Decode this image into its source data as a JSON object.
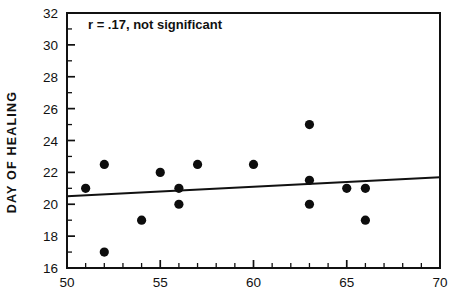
{
  "chart_data": {
    "type": "scatter",
    "title": "",
    "xlabel": "",
    "ylabel": "DAY OF HEALING",
    "xlim": [
      50,
      70
    ],
    "ylim": [
      16,
      32
    ],
    "grid": false,
    "legend": "none",
    "x_ticks": [
      50,
      55,
      60,
      65,
      70
    ],
    "x_tick_labels": [
      "50",
      "55",
      "60",
      "65",
      "70"
    ],
    "x_minor_step": 1,
    "y_ticks": [
      16,
      18,
      20,
      22,
      24,
      26,
      28,
      30,
      32
    ],
    "y_tick_labels": [
      "16",
      "18",
      "20",
      "22",
      "24",
      "26",
      "28",
      "30",
      "32"
    ],
    "y_minor_step": 1,
    "annotation": "r = .17, not significant",
    "correlation_r": 0.17,
    "significance": "not significant",
    "marker": "filled-circle",
    "marker_color": "#0d0d0d",
    "points": [
      {
        "x": 51,
        "y": 21
      },
      {
        "x": 52,
        "y": 22.5
      },
      {
        "x": 52,
        "y": 17
      },
      {
        "x": 54,
        "y": 19
      },
      {
        "x": 55,
        "y": 22
      },
      {
        "x": 56,
        "y": 21
      },
      {
        "x": 56,
        "y": 20
      },
      {
        "x": 57,
        "y": 22.5
      },
      {
        "x": 60,
        "y": 22.5
      },
      {
        "x": 63,
        "y": 25
      },
      {
        "x": 63,
        "y": 21.5
      },
      {
        "x": 63,
        "y": 20
      },
      {
        "x": 65,
        "y": 21
      },
      {
        "x": 66,
        "y": 21
      },
      {
        "x": 66,
        "y": 19
      }
    ],
    "fit_line": {
      "x_start": 50,
      "y_start": 20.5,
      "x_end": 70,
      "y_end": 21.7
    }
  },
  "colors": {
    "axis": "#111111",
    "marker": "#0d0d0d",
    "background": "#ffffff"
  }
}
